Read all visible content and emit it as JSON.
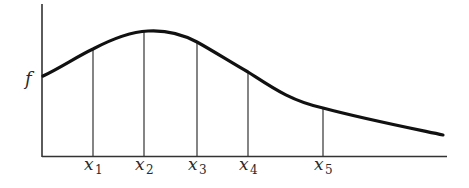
{
  "diagram": {
    "y_label": "f",
    "curve_color": "#111111",
    "axis_color": "#333333",
    "points": [
      {
        "name": "x",
        "sub": "1",
        "x": 93,
        "y": 49
      },
      {
        "name": "x",
        "sub": "2",
        "x": 144,
        "y": 32
      },
      {
        "name": "x",
        "sub": "3",
        "x": 197,
        "y": 42
      },
      {
        "name": "x",
        "sub": "4",
        "x": 248,
        "y": 72
      },
      {
        "name": "x",
        "sub": "5",
        "x": 323,
        "y": 108
      }
    ]
  }
}
